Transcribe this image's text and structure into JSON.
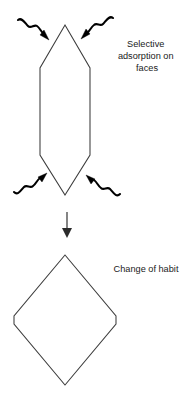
{
  "diagram": {
    "background_color": "#ffffff",
    "outline_color": "#3c3c3c",
    "arrow_color": "#000000",
    "text_color": "#1a1a1a",
    "labels": {
      "selective_adsorption_line1": "Selective",
      "selective_adsorption_line2": "adsorption on",
      "selective_adsorption_line3": "faces",
      "change_of_habit": "Change of habit"
    },
    "shapes": {
      "crystal_initial": {
        "name": "elongated-hexagonal-crystal",
        "points": "65,25 90,68 90,155 65,195 40,155 40,68"
      },
      "crystal_final": {
        "name": "rhombic-diamond-crystal",
        "points": "65,255 116,316 116,324 65,385 14,324 14,316"
      }
    },
    "wavy_arrows": [
      {
        "name": "wavy-arrow-top-left",
        "direction": "down-right",
        "path": "M 18,20 C 22,17 25,23 28,26 C 31,29 34,24 37,26 C 40,28 41,32 44,34",
        "head": "49,40 40,35 44,30"
      },
      {
        "name": "wavy-arrow-top-right",
        "direction": "down-left",
        "path": "M 113,18 C 109,15 106,21 103,24 C 100,27 97,22 94,25 C 91,27 90,31 87,33",
        "head": "81,39 90,34 86,29"
      },
      {
        "name": "wavy-arrow-bottom-left",
        "direction": "up-right",
        "path": "M 14,192 C 18,196 21,190 24,187 C 27,184 30,189 33,186 C 36,184 37,180 40,178",
        "head": "47,173 38,177 42,182"
      },
      {
        "name": "wavy-arrow-bottom-right",
        "direction": "up-left",
        "path": "M 120,194 C 116,198 113,192 110,189 C 107,186 104,191 101,188 C 98,186 97,182 94,180",
        "head": "86,175 95,179 91,184"
      }
    ],
    "transition_arrow": {
      "name": "downward-transition-arrow",
      "x": 67,
      "y_start": 212,
      "y_end": 230,
      "head_points": "67,238 62,228 72,228"
    },
    "label_positions": {
      "selective_adsorption": {
        "x": 147,
        "y": 47,
        "anchor": "middle",
        "line_height": 12
      },
      "change_of_habit": {
        "x": 146,
        "y": 272,
        "anchor": "middle"
      }
    }
  }
}
